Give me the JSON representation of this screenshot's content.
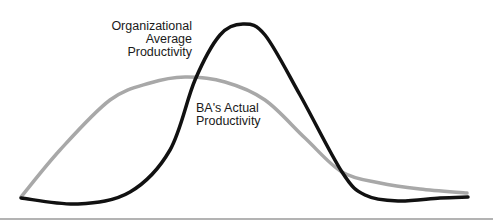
{
  "chart_data": {
    "type": "line",
    "title": "",
    "xlabel": "",
    "ylabel": "",
    "grid": false,
    "legend": "inline annotations",
    "series": [
      {
        "name": "Organizational Average Productivity",
        "color": "#111111",
        "shape": "sharp bell curve, centered peak",
        "points": [
          [
            21,
            198
          ],
          [
            78,
            204
          ],
          [
            130,
            192
          ],
          [
            170,
            150
          ],
          [
            195,
            80
          ],
          [
            220,
            35
          ],
          [
            243,
            24
          ],
          [
            265,
            35
          ],
          [
            300,
            95
          ],
          [
            342,
            172
          ],
          [
            365,
            195
          ],
          [
            398,
            201
          ],
          [
            440,
            198
          ],
          [
            468,
            197
          ]
        ]
      },
      {
        "name": "BA's Actual Productivity",
        "color": "#a8a8a8",
        "shape": "broad early-peaking bell curve",
        "points": [
          [
            21,
            197
          ],
          [
            60,
            150
          ],
          [
            110,
            100
          ],
          [
            150,
            83
          ],
          [
            185,
            77
          ],
          [
            225,
            82
          ],
          [
            265,
            100
          ],
          [
            305,
            138
          ],
          [
            342,
            172
          ],
          [
            380,
            183
          ],
          [
            420,
            189
          ],
          [
            467,
            193
          ]
        ]
      }
    ],
    "baseline": {
      "y": 219,
      "color": "#9a9a9a"
    }
  },
  "labels": {
    "org": [
      "Organizational",
      "Average",
      "Productivity"
    ],
    "ba": [
      "BA's Actual",
      "Productivity"
    ]
  },
  "colors": {
    "org_line": "#111111",
    "ba_line": "#a8a8a8",
    "baseline": "#9a9a9a",
    "text": "#1a1a1a"
  }
}
